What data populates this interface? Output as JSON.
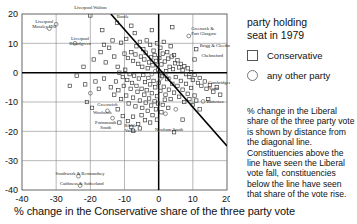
{
  "chart_data": {
    "type": "scatter",
    "title": "",
    "xlabel": "% change in the Conservative share of the three party vote",
    "ylabel": "",
    "xlim": [
      -40,
      20
    ],
    "ylim": [
      -40,
      20
    ],
    "xticks": [
      -40,
      -30,
      -20,
      -10,
      0,
      10,
      20
    ],
    "yticks": [
      20,
      10,
      0,
      -10,
      -20,
      -30,
      -40
    ],
    "grid": true,
    "legend_position": "right",
    "series": [
      {
        "name": "Conservative",
        "marker": "square",
        "color": "#333333"
      },
      {
        "name": "any other party",
        "marker": "circle",
        "color": "#666666"
      }
    ],
    "reference_line": {
      "name": "diagonal-line",
      "x1": -14,
      "y1": 20,
      "x2": 20,
      "y2": -25
    },
    "annotations": [
      {
        "label": "Liverpool Walton",
        "x": -20.0,
        "y": 21.6
      },
      {
        "label": "Liverpool Mossley Hill",
        "x": -33.5,
        "y": 17.0
      },
      {
        "label": "Liverpool Broadgreen",
        "x": -23.0,
        "y": 11.2
      },
      {
        "label": "Bootle",
        "x": -10.5,
        "y": 18.6
      },
      {
        "label": "Greenock & Port Glasgow",
        "x": 9.5,
        "y": 14.5
      },
      {
        "label": "Brigg & Cleethorpes",
        "x": 12.0,
        "y": 8.6
      },
      {
        "label": "Chelmsford",
        "x": 12.5,
        "y": 5.2
      },
      {
        "label": "Cambridgeshire North",
        "x": 14.5,
        "y": -4.0
      },
      {
        "label": "Battersea",
        "x": 14.0,
        "y": -10.5
      },
      {
        "label": "Greenwich",
        "x": -15.0,
        "y": -11.5
      },
      {
        "label": "Woolwich",
        "x": -16.5,
        "y": -14.2
      },
      {
        "label": "Portsmouth South",
        "x": -15.5,
        "y": -17.5
      },
      {
        "label": "Ribble Valley",
        "x": -8.2,
        "y": -18.5
      },
      {
        "label": "Newham South",
        "x": 3.0,
        "y": -20.0
      },
      {
        "label": "Southwark & Bermondsey",
        "x": -23.0,
        "y": -35.0
      },
      {
        "label": "Caithness & Sutherland",
        "x": -22.5,
        "y": -38.2
      }
    ],
    "points": [
      {
        "x": -20.0,
        "y": 19.5,
        "t": "s"
      },
      {
        "x": -12.2,
        "y": 17.0,
        "t": "s"
      },
      {
        "x": -16.5,
        "y": 14.5,
        "t": "s"
      },
      {
        "x": -32.0,
        "y": 15.0,
        "t": "c"
      },
      {
        "x": -24.5,
        "y": 10.0,
        "t": "c"
      },
      {
        "x": -8.0,
        "y": 16.0,
        "t": "s"
      },
      {
        "x": -7.0,
        "y": 13.5,
        "t": "s"
      },
      {
        "x": -2.0,
        "y": 14.5,
        "t": "s"
      },
      {
        "x": 4.0,
        "y": 15.5,
        "t": "s"
      },
      {
        "x": 8.8,
        "y": 12.5,
        "t": "c"
      },
      {
        "x": 11.0,
        "y": 8.0,
        "t": "s"
      },
      {
        "x": 10.5,
        "y": 4.5,
        "t": "s"
      },
      {
        "x": -13.5,
        "y": 11.0,
        "t": "s"
      },
      {
        "x": -11.0,
        "y": 10.2,
        "t": "s"
      },
      {
        "x": -9.5,
        "y": 11.5,
        "t": "s"
      },
      {
        "x": -6.5,
        "y": 9.0,
        "t": "s"
      },
      {
        "x": -5.5,
        "y": 10.5,
        "t": "s"
      },
      {
        "x": -4.5,
        "y": 8.0,
        "t": "s"
      },
      {
        "x": -3.5,
        "y": 11.0,
        "t": "s"
      },
      {
        "x": -2.5,
        "y": 9.5,
        "t": "s"
      },
      {
        "x": -1.5,
        "y": 7.5,
        "t": "s"
      },
      {
        "x": -0.5,
        "y": 10.0,
        "t": "s"
      },
      {
        "x": 0.5,
        "y": 8.5,
        "t": "s"
      },
      {
        "x": 1.5,
        "y": 10.5,
        "t": "s"
      },
      {
        "x": 2.5,
        "y": 7.0,
        "t": "s"
      },
      {
        "x": 3.5,
        "y": 9.0,
        "t": "s"
      },
      {
        "x": 4.5,
        "y": 6.0,
        "t": "s"
      },
      {
        "x": -10.0,
        "y": 6.5,
        "t": "s"
      },
      {
        "x": -9.0,
        "y": 5.0,
        "t": "s"
      },
      {
        "x": -8.0,
        "y": 7.0,
        "t": "s"
      },
      {
        "x": -7.5,
        "y": 4.0,
        "t": "s"
      },
      {
        "x": -6.8,
        "y": 6.2,
        "t": "s"
      },
      {
        "x": -6.0,
        "y": 3.0,
        "t": "s"
      },
      {
        "x": -5.2,
        "y": 5.5,
        "t": "s"
      },
      {
        "x": -4.8,
        "y": 2.0,
        "t": "s"
      },
      {
        "x": -4.2,
        "y": 4.5,
        "t": "s"
      },
      {
        "x": -3.8,
        "y": 6.8,
        "t": "s"
      },
      {
        "x": -3.2,
        "y": 1.5,
        "t": "s"
      },
      {
        "x": -2.8,
        "y": 3.5,
        "t": "s"
      },
      {
        "x": -2.2,
        "y": 5.2,
        "t": "s"
      },
      {
        "x": -1.8,
        "y": 2.5,
        "t": "s"
      },
      {
        "x": -1.2,
        "y": 6.0,
        "t": "s"
      },
      {
        "x": -0.8,
        "y": 4.0,
        "t": "s"
      },
      {
        "x": -0.2,
        "y": 1.0,
        "t": "s"
      },
      {
        "x": 0.2,
        "y": 5.0,
        "t": "s"
      },
      {
        "x": 0.8,
        "y": 2.8,
        "t": "s"
      },
      {
        "x": 1.2,
        "y": 6.5,
        "t": "s"
      },
      {
        "x": 1.8,
        "y": 3.8,
        "t": "s"
      },
      {
        "x": 2.2,
        "y": 0.5,
        "t": "s"
      },
      {
        "x": 2.8,
        "y": 4.8,
        "t": "s"
      },
      {
        "x": 3.2,
        "y": 2.0,
        "t": "s"
      },
      {
        "x": 3.8,
        "y": 5.5,
        "t": "s"
      },
      {
        "x": 4.2,
        "y": 1.2,
        "t": "s"
      },
      {
        "x": 4.8,
        "y": 3.2,
        "t": "s"
      },
      {
        "x": 5.5,
        "y": 4.2,
        "t": "s"
      },
      {
        "x": 6.0,
        "y": 1.8,
        "t": "s"
      },
      {
        "x": 6.5,
        "y": 3.0,
        "t": "s"
      },
      {
        "x": 7.0,
        "y": 0.8,
        "t": "s"
      },
      {
        "x": 7.5,
        "y": 2.2,
        "t": "s"
      },
      {
        "x": 8.0,
        "y": -0.5,
        "t": "s"
      },
      {
        "x": 8.5,
        "y": 1.5,
        "t": "s"
      },
      {
        "x": 9.0,
        "y": -1.5,
        "t": "s"
      },
      {
        "x": 9.5,
        "y": 0.2,
        "t": "s"
      },
      {
        "x": 10.0,
        "y": -2.5,
        "t": "s"
      },
      {
        "x": 10.5,
        "y": -0.8,
        "t": "s"
      },
      {
        "x": 11.5,
        "y": -3.5,
        "t": "s"
      },
      {
        "x": 12.0,
        "y": -1.8,
        "t": "s"
      },
      {
        "x": 12.5,
        "y": -4.5,
        "t": "s"
      },
      {
        "x": 13.5,
        "y": -3.0,
        "t": "s"
      },
      {
        "x": 14.0,
        "y": -5.5,
        "t": "s"
      },
      {
        "x": 15.0,
        "y": -4.2,
        "t": "s"
      },
      {
        "x": 16.0,
        "y": -6.5,
        "t": "s"
      },
      {
        "x": 17.0,
        "y": -5.0,
        "t": "s"
      },
      {
        "x": 18.0,
        "y": -7.5,
        "t": "s"
      },
      {
        "x": 13.0,
        "y": -9.8,
        "t": "c"
      },
      {
        "x": -12.0,
        "y": 2.0,
        "t": "s"
      },
      {
        "x": -11.5,
        "y": 0.0,
        "t": "s"
      },
      {
        "x": -10.5,
        "y": -1.5,
        "t": "s"
      },
      {
        "x": -9.8,
        "y": 1.0,
        "t": "s"
      },
      {
        "x": -9.2,
        "y": -2.5,
        "t": "s"
      },
      {
        "x": -8.5,
        "y": -0.5,
        "t": "s"
      },
      {
        "x": -7.8,
        "y": -3.5,
        "t": "s"
      },
      {
        "x": -7.2,
        "y": -1.0,
        "t": "s"
      },
      {
        "x": -6.5,
        "y": -4.5,
        "t": "s"
      },
      {
        "x": -5.8,
        "y": -2.0,
        "t": "s"
      },
      {
        "x": -5.0,
        "y": -5.5,
        "t": "s"
      },
      {
        "x": -4.5,
        "y": -0.8,
        "t": "s"
      },
      {
        "x": -4.0,
        "y": -3.2,
        "t": "s"
      },
      {
        "x": -3.5,
        "y": -6.0,
        "t": "s"
      },
      {
        "x": -3.0,
        "y": -1.8,
        "t": "s"
      },
      {
        "x": -2.5,
        "y": -4.0,
        "t": "s"
      },
      {
        "x": -2.0,
        "y": -7.0,
        "t": "s"
      },
      {
        "x": -1.5,
        "y": -2.8,
        "t": "s"
      },
      {
        "x": -1.0,
        "y": -5.0,
        "t": "s"
      },
      {
        "x": -0.5,
        "y": -8.0,
        "t": "s"
      },
      {
        "x": 0.0,
        "y": -3.5,
        "t": "s"
      },
      {
        "x": 0.5,
        "y": -6.2,
        "t": "s"
      },
      {
        "x": 1.0,
        "y": -1.2,
        "t": "s"
      },
      {
        "x": 1.5,
        "y": -4.8,
        "t": "s"
      },
      {
        "x": 2.0,
        "y": -7.5,
        "t": "s"
      },
      {
        "x": 2.5,
        "y": -2.2,
        "t": "s"
      },
      {
        "x": 3.0,
        "y": -5.8,
        "t": "s"
      },
      {
        "x": 3.5,
        "y": -9.0,
        "t": "s"
      },
      {
        "x": 4.0,
        "y": -3.8,
        "t": "s"
      },
      {
        "x": 4.5,
        "y": -6.8,
        "t": "s"
      },
      {
        "x": 5.0,
        "y": -1.5,
        "t": "s"
      },
      {
        "x": 5.5,
        "y": -4.5,
        "t": "s"
      },
      {
        "x": 6.0,
        "y": -8.2,
        "t": "s"
      },
      {
        "x": 6.5,
        "y": -2.8,
        "t": "s"
      },
      {
        "x": 7.0,
        "y": -5.8,
        "t": "s"
      },
      {
        "x": 7.5,
        "y": -10.0,
        "t": "s"
      },
      {
        "x": 8.0,
        "y": -3.8,
        "t": "s"
      },
      {
        "x": 8.5,
        "y": -7.2,
        "t": "s"
      },
      {
        "x": 9.0,
        "y": -9.0,
        "t": "s"
      },
      {
        "x": 9.5,
        "y": -5.2,
        "t": "s"
      },
      {
        "x": 10.0,
        "y": -11.0,
        "t": "s"
      },
      {
        "x": 10.5,
        "y": -7.8,
        "t": "s"
      },
      {
        "x": 11.0,
        "y": -9.5,
        "t": "s"
      },
      {
        "x": 5.0,
        "y": -12.5,
        "t": "c"
      },
      {
        "x": 2.0,
        "y": -14.0,
        "t": "c"
      },
      {
        "x": -14.0,
        "y": -5.0,
        "t": "s"
      },
      {
        "x": -13.0,
        "y": -7.5,
        "t": "s"
      },
      {
        "x": -12.5,
        "y": -3.0,
        "t": "s"
      },
      {
        "x": -11.8,
        "y": -6.0,
        "t": "s"
      },
      {
        "x": -11.0,
        "y": -9.0,
        "t": "s"
      },
      {
        "x": -10.2,
        "y": -4.5,
        "t": "s"
      },
      {
        "x": -9.5,
        "y": -7.8,
        "t": "s"
      },
      {
        "x": -8.8,
        "y": -10.5,
        "t": "s"
      },
      {
        "x": -8.2,
        "y": -5.5,
        "t": "s"
      },
      {
        "x": -7.5,
        "y": -8.5,
        "t": "s"
      },
      {
        "x": -6.8,
        "y": -11.5,
        "t": "s"
      },
      {
        "x": -6.2,
        "y": -6.5,
        "t": "s"
      },
      {
        "x": -5.5,
        "y": -9.5,
        "t": "s"
      },
      {
        "x": -4.8,
        "y": -12.0,
        "t": "s"
      },
      {
        "x": -4.2,
        "y": -7.5,
        "t": "s"
      },
      {
        "x": -3.8,
        "y": -10.2,
        "t": "s"
      },
      {
        "x": -3.2,
        "y": -13.0,
        "t": "s"
      },
      {
        "x": -2.8,
        "y": -8.8,
        "t": "s"
      },
      {
        "x": -2.2,
        "y": -11.2,
        "t": "s"
      },
      {
        "x": -1.8,
        "y": -14.5,
        "t": "s"
      },
      {
        "x": -1.2,
        "y": -9.8,
        "t": "s"
      },
      {
        "x": -0.8,
        "y": -12.5,
        "t": "s"
      },
      {
        "x": -0.2,
        "y": -10.5,
        "t": "s"
      },
      {
        "x": 0.8,
        "y": -13.5,
        "t": "s"
      },
      {
        "x": 1.2,
        "y": -11.0,
        "t": "s"
      },
      {
        "x": 1.8,
        "y": -9.2,
        "t": "s"
      },
      {
        "x": 2.8,
        "y": -12.0,
        "t": "s"
      },
      {
        "x": -16.0,
        "y": -2.0,
        "t": "s"
      },
      {
        "x": -17.5,
        "y": -5.5,
        "t": "s"
      },
      {
        "x": -18.5,
        "y": -3.0,
        "t": "s"
      },
      {
        "x": -20.0,
        "y": -7.0,
        "t": "c"
      },
      {
        "x": -21.5,
        "y": -4.0,
        "t": "s"
      },
      {
        "x": -15.0,
        "y": -13.0,
        "t": "c"
      },
      {
        "x": -13.5,
        "y": -15.5,
        "t": "c"
      },
      {
        "x": -12.0,
        "y": -12.5,
        "t": "s"
      },
      {
        "x": -10.5,
        "y": -14.8,
        "t": "s"
      },
      {
        "x": -9.0,
        "y": -16.5,
        "t": "s"
      },
      {
        "x": -7.5,
        "y": -15.0,
        "t": "s"
      },
      {
        "x": -6.0,
        "y": -17.5,
        "t": "s"
      },
      {
        "x": -8.0,
        "y": -18.5,
        "t": "s"
      },
      {
        "x": -5.0,
        "y": -14.5,
        "t": "s"
      },
      {
        "x": -11.5,
        "y": -17.0,
        "t": "s"
      },
      {
        "x": -24.0,
        "y": -1.0,
        "t": "s"
      },
      {
        "x": -26.0,
        "y": -4.5,
        "t": "s"
      },
      {
        "x": -22.0,
        "y": 2.0,
        "t": "s"
      },
      {
        "x": -19.0,
        "y": 4.5,
        "t": "s"
      },
      {
        "x": -17.0,
        "y": 7.0,
        "t": "s"
      },
      {
        "x": -15.5,
        "y": 3.5,
        "t": "s"
      },
      {
        "x": -14.5,
        "y": 8.5,
        "t": "s"
      },
      {
        "x": -13.0,
        "y": 5.5,
        "t": "s"
      },
      {
        "x": -16.0,
        "y": 9.5,
        "t": "s"
      },
      {
        "x": -23.5,
        "y": -35.3,
        "t": "c"
      },
      {
        "x": -23.0,
        "y": -38.5,
        "t": "c"
      },
      {
        "x": 4.5,
        "y": -20.3,
        "t": "s"
      },
      {
        "x": -7.5,
        "y": -19.8,
        "t": "s"
      },
      {
        "x": -5.5,
        "y": -19.0,
        "t": "s"
      },
      {
        "x": 7.0,
        "y": -16.0,
        "t": "s"
      },
      {
        "x": -30.0,
        "y": 16.5,
        "t": "c"
      },
      {
        "x": -21.0,
        "y": -10.0,
        "t": "s"
      },
      {
        "x": -19.5,
        "y": -12.0,
        "t": "s"
      },
      {
        "x": 12.0,
        "y": -12.5,
        "t": "s"
      },
      {
        "x": 14.5,
        "y": -9.0,
        "t": "s"
      },
      {
        "x": -0.5,
        "y": -16.0,
        "t": "s"
      },
      {
        "x": -2.5,
        "y": -17.0,
        "t": "s"
      },
      {
        "x": -4.0,
        "y": -16.2,
        "t": "s"
      },
      {
        "x": 0.5,
        "y": -2.0,
        "t": "c"
      },
      {
        "x": -1.0,
        "y": 0.5,
        "t": "c"
      },
      {
        "x": 1.0,
        "y": -0.2,
        "t": "c"
      },
      {
        "x": -2.0,
        "y": -0.5,
        "t": "c"
      },
      {
        "x": 2.0,
        "y": -1.0,
        "t": "c"
      },
      {
        "x": -0.5,
        "y": 2.5,
        "t": "c"
      },
      {
        "x": 3.0,
        "y": -2.0,
        "t": "c"
      }
    ]
  },
  "legend": {
    "title_line1": "party holding",
    "title_line2": "seat in 1979",
    "entries": [
      {
        "marker": "square",
        "label": "Conservative"
      },
      {
        "marker": "circle",
        "label": "any other party"
      }
    ]
  },
  "note": {
    "text": "% change in the Liberal share of the three party vote is shown by distance from the diagonal line. Constituencies above the line have seen the Liberal vote fall, constituencies below the line have seen that share of the vote rise."
  }
}
